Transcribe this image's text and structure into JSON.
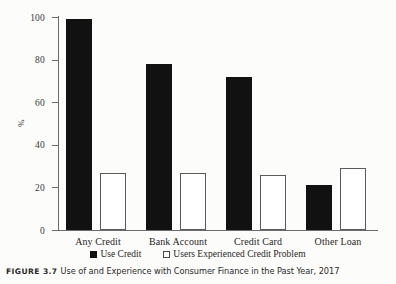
{
  "chart_data": {
    "type": "bar",
    "title": "",
    "xlabel": "",
    "ylabel": "%",
    "ylim": [
      0,
      100
    ],
    "yticks": [
      0,
      20,
      40,
      60,
      80,
      100
    ],
    "grid": false,
    "legend_position": "bottom-center",
    "categories": [
      "Any Credit",
      "Bank Account",
      "Credit Card",
      "Other Loan"
    ],
    "series": [
      {
        "name": "Use Credit",
        "style": "solid",
        "color": "#111111",
        "values": [
          99,
          78,
          72,
          21
        ]
      },
      {
        "name": "Users Experienced Credit Problem",
        "style": "hollow",
        "color": "#ffffff",
        "values": [
          27,
          27,
          26,
          29
        ]
      }
    ]
  },
  "legend": {
    "entries": [
      {
        "label": "Use Credit",
        "style": "solid"
      },
      {
        "label": "Users Experienced Credit Problem",
        "style": "hollow"
      }
    ]
  },
  "caption": {
    "label": "FIGURE 3.7",
    "text": "Use of and Experience with Consumer Finance in the Past Year, 2017"
  }
}
